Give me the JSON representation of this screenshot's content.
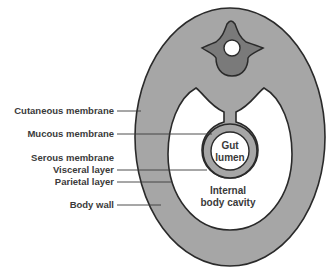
{
  "diagram": {
    "type": "anatomical cross-section",
    "colors": {
      "body_wall": "#a6a6a6",
      "vertebra": "#7a7a7a",
      "outline": "#2a2a2a",
      "cavity": "#ffffff",
      "text": "#3a3a3a"
    },
    "labels": [
      {
        "text": "Cutaneous membrane"
      },
      {
        "text": "Mucous membrane"
      },
      {
        "text": "Serous membrane"
      },
      {
        "text": "Visceral layer"
      },
      {
        "text": "Parietal layer"
      },
      {
        "text": "Body wall"
      }
    ],
    "inner_labels": {
      "gut_line1": "Gut",
      "gut_line2": "lumen",
      "cavity_line1": "Internal",
      "cavity_line2": "body cavity"
    }
  }
}
